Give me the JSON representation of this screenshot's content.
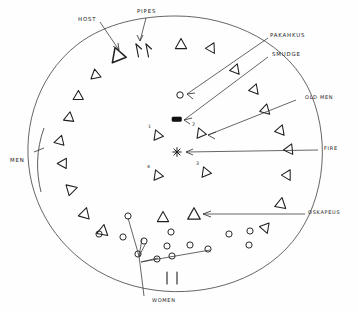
{
  "diagram": {
    "ink_color": "#1f1f1f",
    "paper_color": "#fefefe"
  },
  "labels": {
    "host": "HOST",
    "pipes": "PIPES",
    "pakahkus": "PAKAHKUS",
    "smudge": "SMUDGE",
    "old_men": "OLD MEN",
    "fire": "FIRE",
    "oskapeus": "OSKAPEUS",
    "men": "MEN",
    "women": "WOMEN"
  },
  "inner_numbers": {
    "one": "1",
    "two": "2",
    "three": "3",
    "four": "4"
  },
  "icons": {
    "lodge_circle": "circle-outline",
    "seat_marker": "triangle-icon",
    "woman_marker": "circle-icon",
    "fire_marker": "star-asterisk-icon",
    "smudge_marker": "filled-rectangle-icon",
    "pipe_marker": "forked-pipe-icon",
    "doorway_marker": "double-bar-icon",
    "men_bracket": "arc-bracket-icon",
    "pointer": "arrow-icon"
  },
  "counts": {
    "perimeter_triangles": 26,
    "inner_numbered_triangles": 4,
    "women_circles": 14,
    "pipes": 2
  }
}
